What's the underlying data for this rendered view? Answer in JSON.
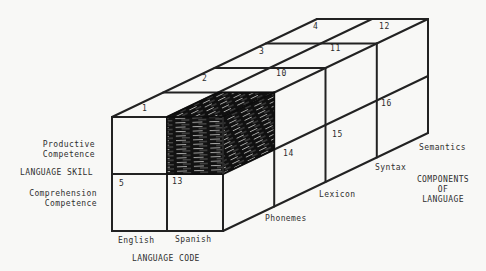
{
  "figure": {
    "skill_axis": {
      "label": "LANGUAGE SKILL",
      "productive": "Productive\nCompetence",
      "comprehension": "Comprehension\nCompetence"
    },
    "code_axis": {
      "label": "LANGUAGE CODE",
      "english": "English",
      "spanish": "Spanish"
    },
    "components_axis": {
      "label": "COMPONENTS\nOF\nLANGUAGE",
      "phonemes": "Phonemes",
      "lexicon": "Lexicon",
      "syntax": "Syntax",
      "semantics": "Semantics"
    },
    "cell_numbers": {
      "c1": "1",
      "c2": "2",
      "c3": "3",
      "c4": "4",
      "c5": "5",
      "c10": "10",
      "c11": "11",
      "c12": "12",
      "c13": "13",
      "c14": "14",
      "c15": "15",
      "c16": "16"
    },
    "colors": {
      "paper": "#f8f8f6",
      "line": "#222222",
      "ink": "#2f2f2f",
      "shaded_block_fill": "#121212"
    }
  }
}
